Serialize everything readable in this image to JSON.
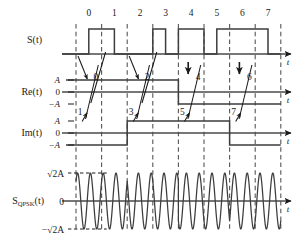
{
  "figure": {
    "axis_label_t": "t"
  },
  "symbol_ruler": {
    "name": "symbol-index-ruler",
    "ticks": [
      "0",
      "1",
      "2",
      "3",
      "4",
      "5",
      "6",
      "7"
    ]
  },
  "rows": [
    {
      "id": "st",
      "label": "S(t)",
      "axis_label": "t",
      "y_ticks": []
    },
    {
      "id": "re",
      "label": "Re(t)",
      "axis_label": "t",
      "y_ticks": [
        "A",
        "0",
        "−A"
      ]
    },
    {
      "id": "im",
      "label": "Im(t)",
      "axis_label": "t",
      "y_ticks": [
        "A",
        "0",
        "−A"
      ]
    },
    {
      "id": "qpsk",
      "label_main": "S",
      "label_sub": "QPSK",
      "label_tail": "(t)",
      "axis_label": "t",
      "y_ticks": [
        "√2A",
        "0",
        "−√2A"
      ]
    }
  ],
  "annotations": {
    "upper_digits": [
      "0",
      "2",
      "4",
      "6"
    ],
    "lower_digits": [
      "1",
      "3",
      "5",
      "7"
    ]
  },
  "chart_data": {
    "type": "line",
    "xlabel": "t",
    "ylabel": "",
    "grid": "dashed vertical symbol boundaries",
    "legend": "none",
    "bit_stream": [
      0,
      1,
      0,
      0,
      1,
      0,
      1,
      0,
      1,
      1,
      0,
      1,
      1,
      1,
      1,
      0
    ],
    "symbol_indices": [
      0,
      1,
      2,
      3,
      4,
      5,
      6,
      7
    ],
    "series": [
      {
        "name": "S(t)",
        "type": "binary-nrz",
        "levels_per_half_symbol": [
          0,
          1,
          1,
          0,
          0,
          0,
          1,
          0,
          1,
          1,
          0,
          1,
          1,
          1,
          1,
          0
        ],
        "low": 0,
        "high": 1
      },
      {
        "name": "Re(t)",
        "type": "nrz",
        "values_per_symbol": [
          "A",
          "A",
          "A",
          "A",
          "-A",
          "-A",
          "-A",
          "-A"
        ],
        "ylim": [
          "-A",
          "A"
        ]
      },
      {
        "name": "Im(t)",
        "type": "nrz",
        "values_per_symbol": [
          "-A",
          "-A",
          "A",
          "A",
          "A",
          "A",
          "-A",
          "-A"
        ],
        "ylim": [
          "-A",
          "A"
        ]
      },
      {
        "name": "S_QPSK(t)",
        "type": "sinusoid",
        "amplitude": "√2A",
        "cycles_per_symbol": 2,
        "phase_per_symbol_deg": [
          315,
          315,
          45,
          45,
          135,
          135,
          225,
          225
        ],
        "ylim": [
          "-√2A",
          "√2A"
        ]
      }
    ]
  },
  "colors": {
    "ink": "#1a1a1a",
    "trace": "#3d3d3d",
    "dash": "#555555",
    "background": "#ffffff"
  }
}
